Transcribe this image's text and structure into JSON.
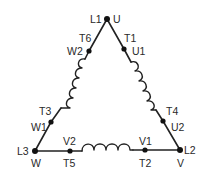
{
  "diagram": {
    "type": "delta-connection-motor-winding",
    "vertices": {
      "top": {
        "labels": [
          "L1",
          "U"
        ]
      },
      "bottom_left": {
        "labels": [
          "L3",
          "W"
        ]
      },
      "bottom_right": {
        "labels": [
          "L2",
          "V"
        ]
      }
    },
    "windings": [
      {
        "name": "left-winding",
        "start_terminal": {
          "labels": [
            "T6",
            "W2"
          ]
        },
        "end_terminal": {
          "labels": [
            "T3",
            "W1"
          ]
        }
      },
      {
        "name": "right-winding",
        "start_terminal": {
          "labels": [
            "T1",
            "U1"
          ]
        },
        "end_terminal": {
          "labels": [
            "T4",
            "U2"
          ]
        }
      },
      {
        "name": "bottom-winding",
        "start_terminal": {
          "labels": [
            "V1",
            "T2"
          ]
        },
        "end_terminal": {
          "labels": [
            "V2",
            "T5"
          ]
        }
      }
    ],
    "labels": {
      "L1": "L1",
      "U": "U",
      "T6": "T6",
      "W2": "W2",
      "T1": "T1",
      "U1": "U1",
      "T3": "T3",
      "W1": "W1",
      "T4": "T4",
      "U2": "U2",
      "L3": "L3",
      "W": "W",
      "L2": "L2",
      "V": "V",
      "V2": "V2",
      "T5": "T5",
      "V1": "V1",
      "T2": "T2"
    },
    "colors": {
      "line": "#222222",
      "node": "#111111",
      "text": "#2a2a2a",
      "background": "#ffffff"
    }
  }
}
